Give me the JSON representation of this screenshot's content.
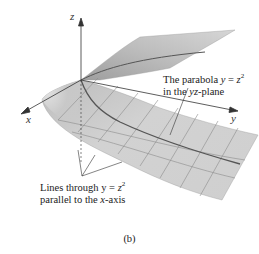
{
  "figure": {
    "caption": "(b)",
    "axes": {
      "x_label": "x",
      "y_label": "y",
      "z_label": "z"
    },
    "annotations": {
      "parabola": {
        "line1_prefix": "The parabola ",
        "line1_eq_var": "y",
        "line1_eq_rest": " = ",
        "line1_eq_z": "z",
        "line1_exp": "2",
        "line2_prefix": "in the ",
        "line2_plane": "yz",
        "line2_suffix": "-plane"
      },
      "lines": {
        "line1_prefix": "Lines through y = ",
        "line1_z": "z",
        "line1_exp": "2",
        "line2_prefix": "parallel to the ",
        "line2_axis": "x",
        "line2_suffix": "-axis"
      }
    },
    "colors": {
      "surface_light": "#d9d9d9",
      "surface_mid": "#c4c4c4",
      "surface_dark": "#a8a8a8",
      "grid_line": "#8c8c8c",
      "parabola_line": "#555555",
      "axis": "#333333"
    }
  }
}
